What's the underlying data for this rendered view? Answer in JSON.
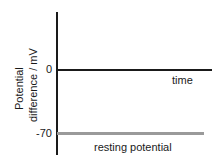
{
  "figure": {
    "background_color": "#ffffff",
    "width": 219,
    "height": 164
  },
  "chart_data": {
    "type": "line",
    "title": "",
    "subtitle": "",
    "xlabel": "time",
    "ylabel": "Potential difference / mV",
    "ylabel_line1": "Potential",
    "ylabel_line2": "difference / mV",
    "x": [
      0,
      1
    ],
    "series": [
      {
        "name": "resting potential",
        "values": [
          -70,
          -70
        ],
        "color": "#9a9a9a"
      }
    ],
    "ytick_labels": [
      "0",
      "-70"
    ],
    "ytick_values": [
      0,
      -70
    ],
    "xtick_labels": [],
    "xlim": [
      0,
      1
    ],
    "ylim": [
      -100,
      40
    ],
    "grid": false,
    "legend": "none",
    "annotations": [
      {
        "name": "resting-potential-label",
        "text": "resting potential"
      }
    ],
    "axis_color": "#1a1a1a",
    "zero_axis_at": 0
  },
  "axes": {
    "y_axis_name": "potential-difference-axis",
    "x_axis_name": "time-axis",
    "zero_tick": "0",
    "neg70_tick": "-70",
    "x_axis_title": "time"
  },
  "trace": {
    "label": "resting potential",
    "color": "#9a9a9a",
    "level_mv": -70
  }
}
